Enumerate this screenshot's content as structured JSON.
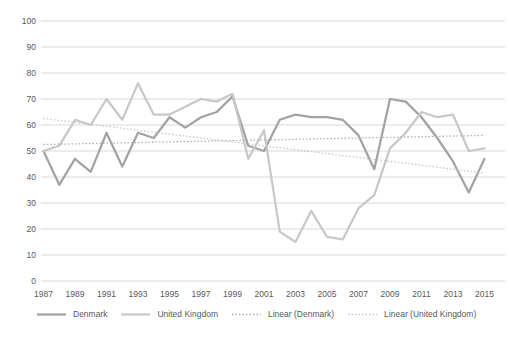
{
  "chart_data": {
    "type": "line",
    "title": "",
    "xlabel": "",
    "ylabel": "",
    "ylim": [
      0,
      100
    ],
    "y_tick_step": 10,
    "grid": "horizontal",
    "legend_position": "bottom",
    "x": [
      1987,
      1988,
      1989,
      1990,
      1991,
      1992,
      1993,
      1994,
      1995,
      1996,
      1997,
      1998,
      1999,
      2000,
      2001,
      2002,
      2003,
      2004,
      2005,
      2006,
      2007,
      2008,
      2009,
      2010,
      2011,
      2012,
      2013,
      2014,
      2015
    ],
    "x_tick_labels": [
      "1987",
      "1989",
      "1991",
      "1993",
      "1995",
      "1997",
      "1999",
      "2001",
      "2003",
      "2005",
      "2007",
      "2009",
      "2011",
      "2013",
      "2015"
    ],
    "y_tick_labels": [
      "0",
      "10",
      "20",
      "30",
      "40",
      "50",
      "60",
      "70",
      "80",
      "90",
      "100"
    ],
    "series": [
      {
        "name": "Denmark",
        "color": "#a3a3a3",
        "values": [
          50,
          37,
          47,
          42,
          57,
          44,
          57,
          55,
          63,
          59,
          63,
          65,
          71,
          52,
          50,
          62,
          64,
          63,
          63,
          62,
          56,
          43,
          70,
          69,
          63,
          55,
          46,
          34,
          47
        ]
      },
      {
        "name": "United Kingdom",
        "color": "#c8c8c8",
        "values": [
          50,
          52,
          62,
          60,
          70,
          62,
          76,
          64,
          64,
          67,
          70,
          69,
          72,
          47,
          58,
          19,
          15,
          27,
          17,
          16,
          28,
          33,
          51,
          57,
          65,
          63,
          64,
          50,
          51
        ]
      }
    ],
    "trendlines": [
      {
        "name": "Linear (Denmark)",
        "color": "#b0b0b0",
        "start": 52.5,
        "end": 56
      },
      {
        "name": "Linear (United Kingdom)",
        "color": "#c8c8c8",
        "start": 62.5,
        "end": 41.5
      }
    ],
    "colors": {
      "gridline": "#d9d9d9",
      "axis_text": "#595959",
      "background": "#ffffff"
    }
  }
}
